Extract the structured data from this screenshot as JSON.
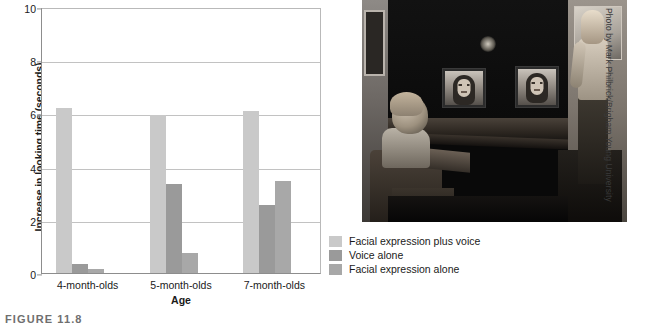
{
  "figure": {
    "caption": "FIGURE 11.8",
    "photo_credit": "Photo by Mark Philbrick/Brigham Young University"
  },
  "chart_data": {
    "type": "bar",
    "title": "",
    "xlabel": "Age",
    "ylabel": "Increase in looking time (seconds)",
    "categories": [
      "4-month-olds",
      "5-month-olds",
      "7-month-olds"
    ],
    "series": [
      {
        "name": "Facial expression plus voice",
        "color": "#c9c9c9",
        "values": [
          6.2,
          5.95,
          6.1
        ]
      },
      {
        "name": "Voice alone",
        "color": "#9a9a9a",
        "values": [
          0.35,
          3.35,
          2.55
        ]
      },
      {
        "name": "Facial expression alone",
        "color": "#a8a8a8",
        "values": [
          0.15,
          0.75,
          3.45
        ]
      }
    ],
    "ylim": [
      0,
      10
    ],
    "yticks": [
      0,
      2,
      4,
      6,
      8,
      10
    ],
    "ytick_labels": [
      "0",
      "2",
      "4",
      "6",
      "8",
      "10"
    ],
    "grid": true,
    "legend_position": "right-bottom"
  },
  "legend": {
    "items": [
      {
        "label": "Facial expression plus voice",
        "color": "#c9c9c9"
      },
      {
        "label": "Voice alone",
        "color": "#9a9a9a"
      },
      {
        "label": "Facial expression alone",
        "color": "#a8a8a8"
      }
    ]
  }
}
